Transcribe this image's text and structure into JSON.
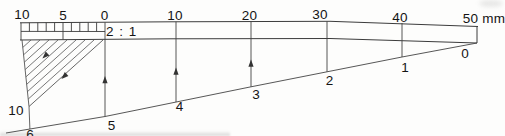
{
  "figure": {
    "ratio_label": "2 : 1",
    "top_scale_labels": [
      "10",
      "5",
      "0",
      "10",
      "20",
      "30",
      "40",
      "50 mm"
    ],
    "bottom_scale_labels": [
      "10",
      "6",
      "5",
      "4",
      "3",
      "2",
      "1",
      "0"
    ]
  },
  "colors": {
    "line": "#3c3c3c",
    "text": "#141414",
    "background": "#fdfdfc"
  }
}
